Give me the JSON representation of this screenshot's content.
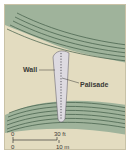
{
  "diagram": {
    "labels": {
      "wall": "Wall",
      "palisade": "Palisade"
    },
    "scale": {
      "top_start": "0",
      "top_end": "30 ft",
      "bottom_start": "0",
      "bottom_end": "10 m"
    },
    "colors": {
      "background": "#e3dcc0",
      "terrain": "#9fb39b",
      "contour": "#3f5a45",
      "wall": "#d9d6dc",
      "frame": "#c9c2a6"
    }
  }
}
